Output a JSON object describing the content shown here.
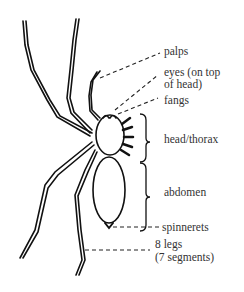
{
  "diagram": {
    "labels": [
      {
        "id": "palps",
        "text": "palps"
      },
      {
        "id": "eyes",
        "text": "eyes (on top",
        "text2": "of head)"
      },
      {
        "id": "fangs",
        "text": "fangs"
      },
      {
        "id": "head-thorax",
        "text": "head/thorax"
      },
      {
        "id": "abdomen",
        "text": "abdomen"
      },
      {
        "id": "spinnerets",
        "text": "spinnerets"
      },
      {
        "id": "legs",
        "text": "8 legs",
        "text2": "(7 segments)"
      }
    ],
    "colors": {
      "line": "#111111",
      "text": "#333333",
      "background": "#ffffff"
    }
  }
}
